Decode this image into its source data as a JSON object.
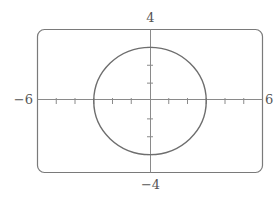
{
  "chart_data": {
    "type": "line",
    "title": "",
    "xlabel": "",
    "ylabel": "",
    "xlim": [
      -6,
      6
    ],
    "ylim": [
      -4,
      4
    ],
    "x_tick_step": 1,
    "y_tick_step": 1,
    "grid": false,
    "legend": null,
    "tick_labels": {
      "x_min": "−6",
      "x_max": "6",
      "y_max": "4",
      "y_min": "−4"
    },
    "series": [
      {
        "name": "circle",
        "shape": "circle",
        "center": [
          0,
          0
        ],
        "radius": 3,
        "x_intercepts": [
          -3,
          3
        ],
        "y_intercepts": [
          -3,
          3
        ]
      }
    ],
    "colors": {
      "frame": "#7a7a7a",
      "curve": "#6e6e6e",
      "axes": "#8a8a8a",
      "labels": "#555555"
    }
  }
}
